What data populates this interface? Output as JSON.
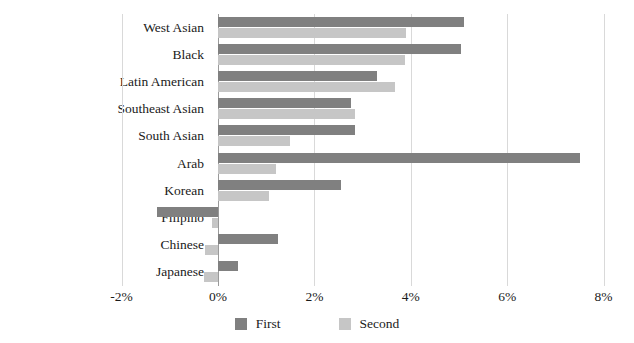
{
  "chart_data": {
    "type": "bar",
    "orientation": "horizontal",
    "title": "",
    "subtitle": "",
    "xlabel": "",
    "ylabel": "",
    "xlim": [
      -2,
      8
    ],
    "xticks": [
      -2,
      0,
      2,
      4,
      6,
      8
    ],
    "xtick_labels": [
      "-2%",
      "0%",
      "2%",
      "4%",
      "6%",
      "8%"
    ],
    "grid": true,
    "grid_axis": "x",
    "legend_position": "bottom-center",
    "categories": [
      "West Asian",
      "Black",
      "Latin American",
      "Southeast Asian",
      "South Asian",
      "Arab",
      "Korean",
      "Filipino",
      "Chinese",
      "Japanese"
    ],
    "series": [
      {
        "name": "First",
        "color": "#808080",
        "values": [
          5.1,
          5.05,
          3.3,
          2.75,
          2.85,
          7.5,
          2.55,
          -1.27,
          1.25,
          0.42
        ]
      },
      {
        "name": "Second",
        "color": "#c6c6c6",
        "values": [
          3.9,
          3.88,
          3.68,
          2.85,
          1.5,
          1.2,
          1.05,
          -0.12,
          -0.27,
          -0.3
        ]
      }
    ]
  },
  "legend": {
    "entries": [
      {
        "label": "First",
        "color": "#808080"
      },
      {
        "label": "Second",
        "color": "#c6c6c6"
      }
    ]
  },
  "colors": {
    "first": "#808080",
    "second": "#c6c6c6",
    "gridline": "#d9d9d9",
    "zero_axis": "#9a9a9a",
    "text": "#1a1a1a",
    "background": "#ffffff"
  }
}
